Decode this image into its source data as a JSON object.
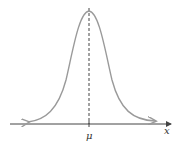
{
  "diagram": {
    "type": "normal-distribution-curve",
    "labels": {
      "mean": "μ",
      "axis": "x"
    },
    "colors": {
      "curve": "#9a9a9a",
      "axis": "#444444",
      "mean_line": "#444444"
    }
  }
}
